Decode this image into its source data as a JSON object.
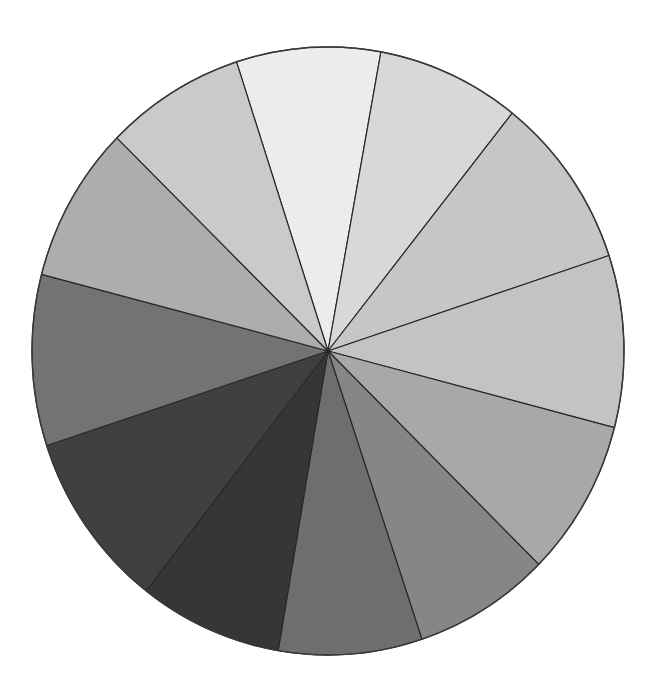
{
  "chart_data": {
    "type": "pie",
    "title": "",
    "legend": "none",
    "start_angle_deg": 342,
    "direction": "clockwise",
    "categories": [
      "S1",
      "S2",
      "S3",
      "S4",
      "S5",
      "S6",
      "S7",
      "S8",
      "S9",
      "S10",
      "S11",
      "S12"
    ],
    "values": [
      28.3,
      28.2,
      33.2,
      32.9,
      30.0,
      26.9,
      28.2,
      28.2,
      34.0,
      32.7,
      29.9,
      27.5
    ],
    "percent": [
      7.9,
      7.8,
      9.2,
      9.1,
      8.3,
      7.5,
      7.8,
      7.8,
      9.4,
      9.1,
      8.3,
      7.6
    ],
    "colors": [
      "#ececec",
      "#d8d8d8",
      "#c6c6c6",
      "#c3c3c3",
      "#a8a8a8",
      "#868686",
      "#6e6e6e",
      "#363636",
      "#404040",
      "#737373",
      "#adadad",
      "#cacaca"
    ],
    "geometry": {
      "cx": 328,
      "cy": 351,
      "rx": 296,
      "ry": 304
    }
  }
}
